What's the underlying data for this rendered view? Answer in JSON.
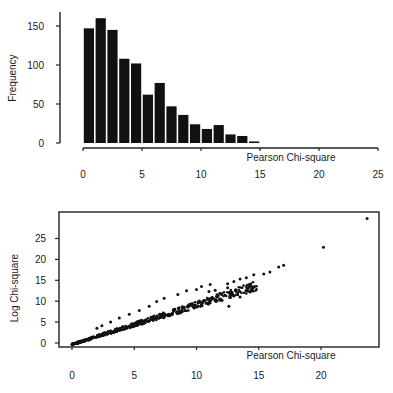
{
  "colors": {
    "ink": "#111111",
    "background": "#ffffff",
    "axis": "#222222"
  },
  "chart_data": [
    {
      "type": "bar",
      "title": "",
      "xlabel": "Pearson Chi-square",
      "ylabel": "Frequency",
      "bin_width": 1,
      "bin_edges": [
        0,
        1,
        2,
        3,
        4,
        5,
        6,
        7,
        8,
        9,
        10,
        11,
        12,
        13,
        14,
        15
      ],
      "values": [
        147,
        160,
        145,
        108,
        102,
        62,
        77,
        47,
        36,
        24,
        18,
        23,
        11,
        9,
        2
      ],
      "xlim": [
        0,
        25
      ],
      "ylim": [
        0,
        165
      ],
      "xticks": [
        0,
        5,
        10,
        15,
        20,
        25
      ],
      "yticks": [
        0,
        50,
        100,
        150
      ],
      "grid": false,
      "legend": null
    },
    {
      "type": "scatter",
      "title": "",
      "xlabel": "Pearson Chi-square",
      "ylabel": "Log Chi-square",
      "xlim": [
        0,
        24.5
      ],
      "ylim": [
        -1,
        30
      ],
      "xticks": [
        0,
        5,
        10,
        15,
        20
      ],
      "yticks": [
        0,
        5,
        10,
        15,
        20,
        25
      ],
      "grid": false,
      "legend": null,
      "trend": {
        "description": "dense near-linear band",
        "slope": 0.93,
        "intercept": -0.4,
        "x_range": [
          0,
          15
        ]
      },
      "notable_points": [
        {
          "x": 23.7,
          "y": 29.8
        },
        {
          "x": 20.2,
          "y": 22.9
        },
        {
          "x": 17.0,
          "y": 18.6
        },
        {
          "x": 16.6,
          "y": 18.2
        },
        {
          "x": 15.9,
          "y": 17.0
        },
        {
          "x": 15.4,
          "y": 16.5
        },
        {
          "x": 14.6,
          "y": 16.3
        },
        {
          "x": 14.0,
          "y": 15.6
        },
        {
          "x": 13.5,
          "y": 15.3
        },
        {
          "x": 13.0,
          "y": 14.7
        },
        {
          "x": 12.5,
          "y": 14.2
        },
        {
          "x": 12.5,
          "y": 13.2
        },
        {
          "x": 12.7,
          "y": 11.3
        },
        {
          "x": 13.5,
          "y": 11.0
        },
        {
          "x": 12.6,
          "y": 8.8
        },
        {
          "x": 11.1,
          "y": 14.0
        },
        {
          "x": 10.4,
          "y": 13.5
        },
        {
          "x": 11.0,
          "y": 12.3
        },
        {
          "x": 11.5,
          "y": 12.6
        },
        {
          "x": 10.0,
          "y": 12.8
        },
        {
          "x": 9.2,
          "y": 12.5
        },
        {
          "x": 8.5,
          "y": 11.6
        },
        {
          "x": 7.4,
          "y": 10.7
        },
        {
          "x": 6.8,
          "y": 9.9
        },
        {
          "x": 6.2,
          "y": 8.8
        },
        {
          "x": 5.4,
          "y": 7.8
        },
        {
          "x": 4.6,
          "y": 6.9
        },
        {
          "x": 3.8,
          "y": 6.0
        },
        {
          "x": 3.1,
          "y": 5.0
        },
        {
          "x": 2.4,
          "y": 4.1
        },
        {
          "x": 2.0,
          "y": 3.5
        }
      ]
    }
  ]
}
